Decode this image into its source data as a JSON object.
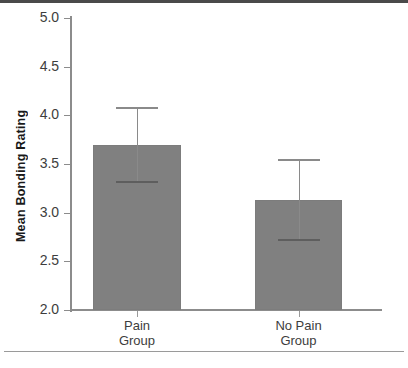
{
  "chart_data": {
    "type": "bar",
    "title": "",
    "xlabel": "",
    "ylabel": "Mean Bonding Rating",
    "categories": [
      "Pain\nGroup",
      "No Pain\nGroup"
    ],
    "category_lines": [
      [
        "Pain",
        "Group"
      ],
      [
        "No Pain",
        "Group"
      ]
    ],
    "values": [
      3.7,
      3.13
    ],
    "errors_upper": [
      4.09,
      3.55
    ],
    "errors_lower": [
      3.33,
      2.73
    ],
    "ylim": [
      2.0,
      5.0
    ],
    "yticks": [
      5.0,
      4.5,
      4.0,
      3.5,
      3.0,
      2.5,
      2.0
    ],
    "ytick_labels": [
      "5.0",
      "4.5",
      "4.0",
      "3.5",
      "3.0",
      "2.5",
      "2.0"
    ],
    "grid": false,
    "legend": null,
    "bar_color": "#808080",
    "error_color": "#8a8a8a",
    "axis_color": "#8c8c8c",
    "text_color": "#3d3d3d"
  },
  "figure": {
    "top_rule_color": "#4a4a4a",
    "bottom_rule_color": "#9a9a9a",
    "background": "#ffffff"
  }
}
